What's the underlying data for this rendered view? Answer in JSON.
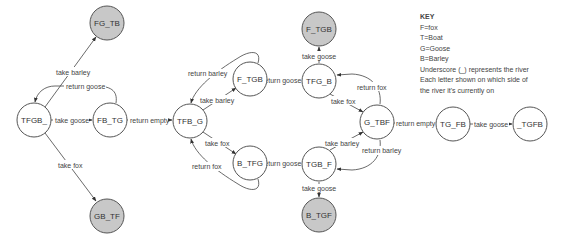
{
  "diagram": {
    "nodes": [
      {
        "id": "TFGB_",
        "label": "TFGB_",
        "x": 34,
        "y": 120,
        "terminal": false
      },
      {
        "id": "FG_TB",
        "label": "FG_TB",
        "x": 107,
        "y": 23,
        "terminal": true
      },
      {
        "id": "FB_TG",
        "label": "FB_TG",
        "x": 110,
        "y": 120,
        "terminal": false
      },
      {
        "id": "GB_TF",
        "label": "GB_TF",
        "x": 107,
        "y": 216,
        "terminal": true
      },
      {
        "id": "TFB_G",
        "label": "TFB_G",
        "x": 190,
        "y": 121,
        "terminal": false
      },
      {
        "id": "F_TGB_mid",
        "label": "F_TGB",
        "x": 250,
        "y": 79,
        "terminal": false
      },
      {
        "id": "B_TFG",
        "label": "B_TFG",
        "x": 250,
        "y": 163,
        "terminal": false
      },
      {
        "id": "F_TGB_top",
        "label": "F_TGB",
        "x": 319,
        "y": 29,
        "terminal": true
      },
      {
        "id": "TFG_B",
        "label": "TFG_B",
        "x": 319,
        "y": 81,
        "terminal": false
      },
      {
        "id": "G_TBF",
        "label": "G_TBF",
        "x": 377,
        "y": 122,
        "terminal": false
      },
      {
        "id": "TGB_F",
        "label": "TGB_F",
        "x": 319,
        "y": 164,
        "terminal": false
      },
      {
        "id": "B_TGF",
        "label": "B_TGF",
        "x": 319,
        "y": 215,
        "terminal": true
      },
      {
        "id": "TG_FB",
        "label": "TG_FB",
        "x": 453,
        "y": 124,
        "terminal": false
      },
      {
        "id": "_TGFB",
        "label": "_TGFB",
        "x": 530,
        "y": 124,
        "terminal": false
      }
    ],
    "edges": [
      {
        "from": "TFGB_",
        "to": "FG_TB",
        "label": "take barley"
      },
      {
        "from": "TFGB_",
        "to": "FB_TG",
        "label": "take goose"
      },
      {
        "from": "FB_TG",
        "to": "TFGB_",
        "label": "return goose"
      },
      {
        "from": "TFGB_",
        "to": "GB_TF",
        "label": "take fox"
      },
      {
        "from": "FB_TG",
        "to": "TFB_G",
        "label": "return empty"
      },
      {
        "from": "TFB_G",
        "to": "F_TGB_mid",
        "label": "take barley"
      },
      {
        "from": "F_TGB_mid",
        "to": "TFB_G",
        "label": "return barley"
      },
      {
        "from": "TFB_G",
        "to": "B_TFG",
        "label": "take fox"
      },
      {
        "from": "B_TFG",
        "to": "TFB_G",
        "label": "return fox"
      },
      {
        "from": "TFG_B",
        "to": "F_TGB_mid",
        "label": "return goose"
      },
      {
        "from": "TGB_F",
        "to": "B_TFG",
        "label": "return goose"
      },
      {
        "from": "TFG_B",
        "to": "F_TGB_top",
        "label": "take goose"
      },
      {
        "from": "TFG_B",
        "to": "G_TBF",
        "label": "take fox"
      },
      {
        "from": "G_TBF",
        "to": "TFG_B",
        "label": "return fox"
      },
      {
        "from": "TGB_F",
        "to": "G_TBF",
        "label": "take barley"
      },
      {
        "from": "G_TBF",
        "to": "TGB_F",
        "label": "return barley"
      },
      {
        "from": "TGB_F",
        "to": "B_TGF",
        "label": "take goose"
      },
      {
        "from": "G_TBF",
        "to": "TG_FB",
        "label": "return empty"
      },
      {
        "from": "TG_FB",
        "to": "_TGFB",
        "label": "take goose"
      }
    ],
    "colors": {
      "terminal_fill": "#c8c8c8",
      "node_fill": "#ffffff",
      "stroke": "#555555"
    }
  },
  "key": {
    "title": "KEY",
    "lines": [
      "F=fox",
      "T=Boat",
      "G=Goose",
      "B=Barley",
      "Underscore (_) represents the river",
      "Each letter shown on which side of",
      "the river it's currently on"
    ]
  }
}
